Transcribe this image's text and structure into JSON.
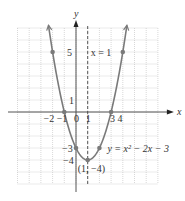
{
  "chart_data": {
    "type": "line",
    "title": "",
    "function": "y = x^2 - 2x - 3",
    "equation_label": "y = x² − 2x − 3",
    "xlabel": "x",
    "ylabel": "y",
    "xlim": [
      -5,
      7
    ],
    "ylim": [
      -6,
      7
    ],
    "grid": true,
    "axis_of_symmetry": {
      "x": 1,
      "label": "x = 1"
    },
    "vertex": {
      "x": 1,
      "y": -4,
      "label": "(1, −4)"
    },
    "points": [
      {
        "x": -2,
        "y": 5
      },
      {
        "x": -1,
        "y": 0
      },
      {
        "x": 0,
        "y": -3
      },
      {
        "x": 1,
        "y": -4
      },
      {
        "x": 2,
        "y": -3
      },
      {
        "x": 3,
        "y": 0
      },
      {
        "x": 4,
        "y": 5
      }
    ],
    "x_tick_labels": [
      "−2",
      "−1",
      "0",
      "1",
      "3",
      "4"
    ],
    "y_tick_labels": [
      "5",
      "1",
      "−3",
      "−4"
    ]
  },
  "colors": {
    "curve": "#7a7a7a",
    "grid": "#bdbdbd",
    "axis": "#555555",
    "text": "#333333"
  }
}
